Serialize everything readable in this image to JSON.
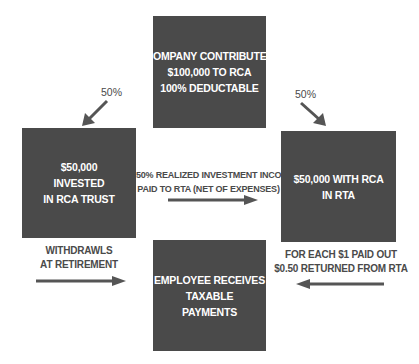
{
  "diagram": {
    "colors": {
      "box_fill": "#4a4a4a",
      "box_text": "#ffffff",
      "label_text": "#4a4a4a",
      "arrow": "#555555",
      "background": "#ffffff"
    },
    "nodes": {
      "company": {
        "lines": [
          "COMPANY CONTRIBUTES",
          "$100,000 TO RCA",
          "100% DEDUCTABLE"
        ]
      },
      "rca_trust": {
        "lines": [
          "$50,000",
          "INVESTED",
          "IN RCA TRUST"
        ]
      },
      "rta": {
        "lines": [
          "$50,000 WITH RCA",
          "IN RTA"
        ]
      },
      "employee": {
        "lines": [
          "EMPLOYEE RECEIVES",
          "TAXABLE",
          "PAYMENTS"
        ]
      }
    },
    "edges": {
      "company_to_trust": {
        "label": "50%"
      },
      "company_to_rta": {
        "label": "50%"
      },
      "trust_to_rta": {
        "lines": [
          "50% REALIZED INVESTMENT INCOME",
          "PAID TO RTA (NET OF EXPENSES)"
        ]
      },
      "trust_to_employee": {
        "lines": [
          "WITHDRAWLS",
          "AT RETIREMENT"
        ]
      },
      "rta_to_employee": {
        "lines": [
          "FOR EACH $1 PAID OUT",
          "$0.50 RETURNED FROM RTA"
        ]
      }
    }
  }
}
